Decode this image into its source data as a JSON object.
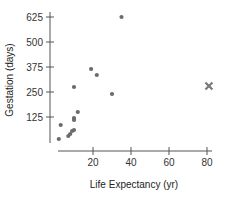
{
  "chart_data": {
    "type": "scatter",
    "title": "",
    "xlabel": "Life Expectancy (yr)",
    "ylabel": "Gestation (days)",
    "xlim": [
      0,
      85
    ],
    "ylim": [
      0,
      640
    ],
    "x_ticks": [
      20,
      40,
      60,
      80
    ],
    "y_ticks": [
      125,
      250,
      375,
      500,
      625
    ],
    "grid": false,
    "legend": null,
    "series": [
      {
        "name": "animals",
        "marker": "circle",
        "color": "#6b6b6b",
        "points": [
          {
            "x": 3,
            "y": 85
          },
          {
            "x": 2,
            "y": 15
          },
          {
            "x": 7,
            "y": 30
          },
          {
            "x": 8,
            "y": 40
          },
          {
            "x": 9,
            "y": 55
          },
          {
            "x": 10,
            "y": 60
          },
          {
            "x": 10,
            "y": 110
          },
          {
            "x": 10,
            "y": 120
          },
          {
            "x": 12,
            "y": 150
          },
          {
            "x": 10,
            "y": 275
          },
          {
            "x": 19,
            "y": 365
          },
          {
            "x": 22,
            "y": 335
          },
          {
            "x": 30,
            "y": 240
          },
          {
            "x": 35,
            "y": 625
          }
        ]
      },
      {
        "name": "outlier",
        "marker": "x",
        "color": "#7a7a7a",
        "points": [
          {
            "x": 81,
            "y": 280
          }
        ]
      }
    ]
  },
  "layout": {
    "x_origin_px": 55,
    "x_scale_px_per_unit": 1.9,
    "y_origin_px": 142,
    "y_scale_px_per_unit": 0.2,
    "x_axis_y_px": 151,
    "x_axis_start_px": 58,
    "x_axis_end_px": 212,
    "y_axis_x_px": 50,
    "y_axis_top_px": 12,
    "y_axis_bottom_px": 143
  }
}
